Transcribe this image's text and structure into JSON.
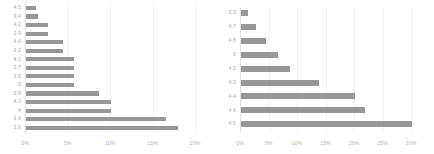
{
  "figure": {
    "title": "",
    "bar_color": "#808080",
    "gridline_color": "#f2f2f2",
    "label_color": "#a8a8a8"
  },
  "chart_data": [
    {
      "id": "left",
      "type": "bar",
      "orientation": "horizontal",
      "title": "",
      "xlabel": "",
      "ylabel": "",
      "grid": true,
      "legend": "none",
      "xlim": [
        0,
        20
      ],
      "xtick_labels": [
        "0%",
        "5%",
        "10%",
        "15%",
        "20%"
      ],
      "xtick_values": [
        0,
        5,
        10,
        15,
        20
      ],
      "categories": [
        "4.5",
        "3.4",
        "4.2",
        "3.9",
        "4.4",
        "3.2",
        "4.1",
        "3.7",
        "3.5",
        "0",
        "3.8",
        "4.3",
        "4",
        "3.6",
        "3.9 "
      ],
      "values": [
        1.2,
        1.4,
        2.6,
        2.6,
        4.3,
        4.3,
        5.7,
        5.7,
        5.7,
        5.7,
        8.6,
        10.0,
        10.0,
        16.5,
        17.9
      ],
      "value_unit": "%"
    },
    {
      "id": "right",
      "type": "bar",
      "orientation": "horizontal",
      "title": "",
      "xlabel": "",
      "ylabel": "",
      "grid": true,
      "legend": "none",
      "xlim": [
        0,
        30
      ],
      "xtick_labels": [
        "0%",
        "5%",
        "10%",
        "15%",
        "20%",
        "25%",
        "30%"
      ],
      "xtick_values": [
        0,
        5,
        10,
        15,
        20,
        25,
        30
      ],
      "categories": [
        "3.3",
        "4.7",
        "4.8",
        "0",
        "4.2",
        "4.3",
        "4.4",
        "4.6",
        "4.5"
      ],
      "values": [
        1.3,
        2.6,
        4.4,
        6.5,
        8.6,
        13.7,
        20.0,
        21.7,
        30.0
      ],
      "value_unit": "%"
    }
  ]
}
